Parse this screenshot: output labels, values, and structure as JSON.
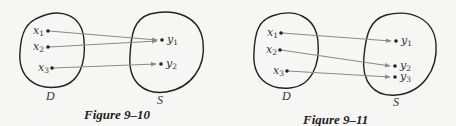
{
  "figures": [
    {
      "caption": "Figure 9–10",
      "domain_label": "D",
      "codomain_label": "S",
      "domain_points": [
        {
          "label": "x",
          "sub": "1"
        },
        {
          "label": "x",
          "sub": "2"
        },
        {
          "label": "x",
          "sub": "3"
        }
      ],
      "codomain_points": [
        {
          "label": "y",
          "sub": "1"
        },
        {
          "label": "y",
          "sub": "2"
        }
      ],
      "mappings": [
        [
          "x1",
          "y1"
        ],
        [
          "x2",
          "y1"
        ],
        [
          "x3",
          "y2"
        ]
      ]
    },
    {
      "caption": "Figure 9–11",
      "domain_label": "D",
      "codomain_label": "S",
      "domain_points": [
        {
          "label": "x",
          "sub": "1"
        },
        {
          "label": "x",
          "sub": "2"
        },
        {
          "label": "x",
          "sub": "3"
        }
      ],
      "codomain_points": [
        {
          "label": "y",
          "sub": "1"
        },
        {
          "label": "y",
          "sub": "2"
        },
        {
          "label": "y",
          "sub": "3"
        }
      ],
      "mappings": [
        [
          "x1",
          "y1"
        ],
        [
          "x2",
          "y2"
        ],
        [
          "x3",
          "y3"
        ]
      ]
    }
  ],
  "colors": {
    "ink": "#222222",
    "arrow": "#8a8a8a",
    "background": "#f6f6f4"
  }
}
